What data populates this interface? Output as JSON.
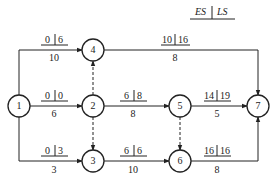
{
  "legend": {
    "es": "ES",
    "ls": "LS"
  },
  "nodes": [
    {
      "id": "1",
      "x": 19,
      "y": 106
    },
    {
      "id": "2",
      "x": 93,
      "y": 106
    },
    {
      "id": "3",
      "x": 93,
      "y": 161
    },
    {
      "id": "4",
      "x": 93,
      "y": 50
    },
    {
      "id": "5",
      "x": 180,
      "y": 106
    },
    {
      "id": "6",
      "x": 180,
      "y": 161
    },
    {
      "id": "7",
      "x": 258,
      "y": 106
    }
  ],
  "activities": [
    {
      "from": "1",
      "to": "4",
      "duration": "10",
      "es": "0",
      "ls": "6"
    },
    {
      "from": "1",
      "to": "2",
      "duration": "6",
      "es": "0",
      "ls": "0"
    },
    {
      "from": "1",
      "to": "3",
      "duration": "3",
      "es": "0",
      "ls": "3"
    },
    {
      "from": "4",
      "to": "7",
      "duration": "8",
      "es": "10",
      "ls": "16"
    },
    {
      "from": "2",
      "to": "5",
      "duration": "8",
      "es": "6",
      "ls": "8"
    },
    {
      "from": "5",
      "to": "7",
      "duration": "5",
      "es": "14",
      "ls": "19"
    },
    {
      "from": "3",
      "to": "6",
      "duration": "10",
      "es": "6",
      "ls": "6"
    },
    {
      "from": "6",
      "to": "7",
      "duration": "8",
      "es": "16",
      "ls": "16"
    }
  ],
  "dummies": [
    {
      "from": "2",
      "to": "4"
    },
    {
      "from": "2",
      "to": "3"
    },
    {
      "from": "5",
      "to": "6"
    }
  ],
  "labels": {
    "n1": "1",
    "n2": "2",
    "n3": "3",
    "n4": "4",
    "n5": "5",
    "n6": "6",
    "n7": "7",
    "a14": {
      "es": "0",
      "ls": "6",
      "d": "10"
    },
    "a12": {
      "es": "0",
      "ls": "0",
      "d": "6"
    },
    "a13": {
      "es": "0",
      "ls": "3",
      "d": "3"
    },
    "a47": {
      "es": "10",
      "ls": "16",
      "d": "8"
    },
    "a25": {
      "es": "6",
      "ls": "8",
      "d": "8"
    },
    "a57": {
      "es": "14",
      "ls": "19",
      "d": "5"
    },
    "a36": {
      "es": "6",
      "ls": "6",
      "d": "10"
    },
    "a67": {
      "es": "16",
      "ls": "16",
      "d": "8"
    }
  }
}
